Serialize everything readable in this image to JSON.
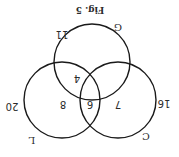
{
  "figure": {
    "caption": "Fig. 5",
    "orientation": "rotated 180 degrees",
    "sets": [
      {
        "name": "G",
        "total": "11"
      },
      {
        "name": "L",
        "total": "20"
      },
      {
        "name": "C",
        "total": "16"
      }
    ],
    "regions": {
      "G_and_L": "4",
      "L_only_inner": "8",
      "L_and_C": "6",
      "C_only_inner": "7"
    }
  }
}
